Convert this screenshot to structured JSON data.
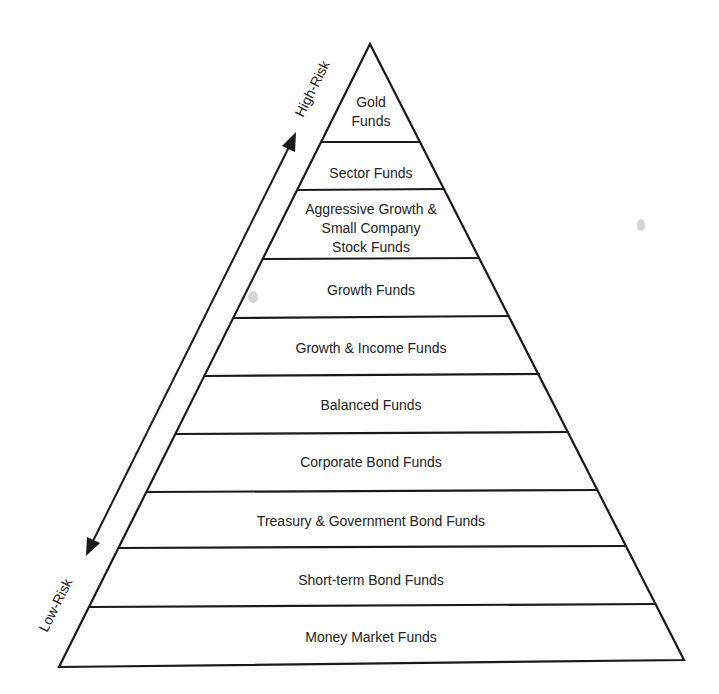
{
  "diagram": {
    "type": "risk-pyramid",
    "axis": {
      "top_label": "High-Risk",
      "bottom_label": "Low-Risk"
    },
    "layers": [
      {
        "lines": [
          "Gold",
          "Funds"
        ]
      },
      {
        "lines": [
          "Sector Funds"
        ]
      },
      {
        "lines": [
          "Aggressive Growth &",
          "Small Company",
          "Stock Funds"
        ]
      },
      {
        "lines": [
          "Growth Funds"
        ]
      },
      {
        "lines": [
          "Growth & Income Funds"
        ]
      },
      {
        "lines": [
          "Balanced Funds"
        ]
      },
      {
        "lines": [
          "Corporate Bond Funds"
        ]
      },
      {
        "lines": [
          "Treasury & Government Bond Funds"
        ]
      },
      {
        "lines": [
          "Short-term Bond Funds"
        ]
      },
      {
        "lines": [
          "Money Market Funds"
        ]
      }
    ],
    "colors": {
      "line": "#1a1a1a",
      "text": "#222222",
      "background": "#ffffff"
    }
  }
}
